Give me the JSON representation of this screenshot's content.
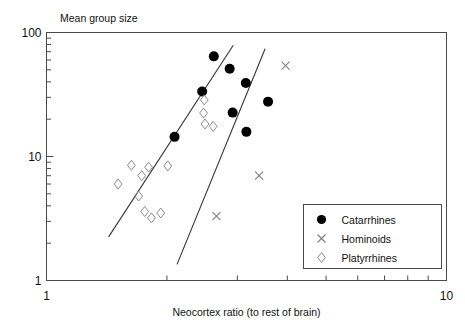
{
  "chart_data": {
    "type": "scatter",
    "title": "",
    "xlabel": "Neocortex ratio (to rest of brain)",
    "ylabel": "Mean group size",
    "xscale": "log",
    "yscale": "log",
    "xlim": [
      1,
      10
    ],
    "ylim": [
      1,
      100
    ],
    "xticks": [
      1,
      10
    ],
    "xtick_labels": [
      "1",
      "10"
    ],
    "yticks": [
      1,
      10,
      100
    ],
    "ytick_labels": [
      "1",
      "10",
      "100"
    ],
    "x_minor_ticks": [
      2,
      3,
      4,
      5,
      6,
      7,
      8,
      9
    ],
    "y_minor_ticks": [
      2,
      3,
      4,
      5,
      6,
      7,
      8,
      9,
      20,
      30,
      40,
      50,
      60,
      70,
      80,
      90
    ],
    "grid": false,
    "legend_position": "bottom-right",
    "series": [
      {
        "name": "Catarrhines",
        "marker": "filled-circle",
        "color": "#000000",
        "points": [
          {
            "x": 2.09,
            "y": 14.4
          },
          {
            "x": 2.45,
            "y": 33.4
          },
          {
            "x": 2.62,
            "y": 64.2
          },
          {
            "x": 2.87,
            "y": 51.0
          },
          {
            "x": 2.92,
            "y": 22.6
          },
          {
            "x": 3.15,
            "y": 39.1
          },
          {
            "x": 3.16,
            "y": 15.8
          },
          {
            "x": 3.58,
            "y": 27.7
          }
        ]
      },
      {
        "name": "Hominoids",
        "marker": "cross",
        "color": "#7d7d7d",
        "points": [
          {
            "x": 2.66,
            "y": 3.3
          },
          {
            "x": 3.4,
            "y": 7.0
          },
          {
            "x": 3.96,
            "y": 54.0
          }
        ]
      },
      {
        "name": "Platyrrhines",
        "marker": "open-diamond",
        "color": "#8a8a8a",
        "points": [
          {
            "x": 1.51,
            "y": 6.0
          },
          {
            "x": 1.63,
            "y": 8.5
          },
          {
            "x": 1.73,
            "y": 7.0
          },
          {
            "x": 1.8,
            "y": 8.2
          },
          {
            "x": 1.7,
            "y": 4.8
          },
          {
            "x": 1.76,
            "y": 3.6
          },
          {
            "x": 1.83,
            "y": 3.2
          },
          {
            "x": 1.93,
            "y": 3.5
          },
          {
            "x": 2.01,
            "y": 8.4
          },
          {
            "x": 2.48,
            "y": 28.6
          },
          {
            "x": 2.47,
            "y": 22.4
          },
          {
            "x": 2.49,
            "y": 18.3
          },
          {
            "x": 2.61,
            "y": 17.5
          }
        ]
      }
    ],
    "fit_lines": [
      {
        "name": "upper-regression-line",
        "x1": 1.43,
        "y1": 2.25,
        "x2": 2.93,
        "y2": 79.0
      },
      {
        "name": "lower-regression-line",
        "x1": 2.12,
        "y1": 1.35,
        "x2": 3.52,
        "y2": 74.0
      }
    ]
  },
  "legend": {
    "entries": [
      {
        "label": "Catarrhines",
        "marker": "filled-circle"
      },
      {
        "label": "Hominoids",
        "marker": "cross"
      },
      {
        "label": "Platyrrhines",
        "marker": "open-diamond"
      }
    ]
  }
}
